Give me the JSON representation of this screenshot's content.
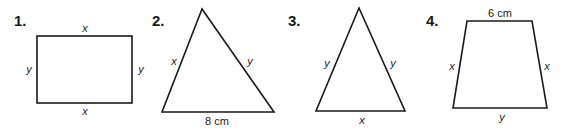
{
  "figures": [
    {
      "number": "1.",
      "shape": "rectangle",
      "labels": {
        "top": "x",
        "left": "y",
        "right": "y",
        "bottom": "x"
      }
    },
    {
      "number": "2.",
      "shape": "triangle",
      "labels": {
        "left": "x",
        "right": "y",
        "bottom": "8 cm"
      }
    },
    {
      "number": "3.",
      "shape": "isosceles-triangle",
      "labels": {
        "left": "y",
        "right": "y",
        "bottom": "x"
      }
    },
    {
      "number": "4.",
      "shape": "trapezoid",
      "labels": {
        "top": "6 cm",
        "left": "x",
        "right": "x",
        "bottom": "y"
      }
    }
  ]
}
